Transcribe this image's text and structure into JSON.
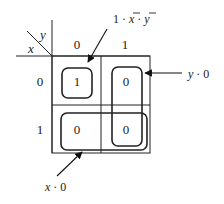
{
  "diagram": {
    "type": "karnaugh-map",
    "row_variable": "x",
    "col_variable": "y",
    "col_headers": [
      "0",
      "1"
    ],
    "row_headers": [
      "0",
      "1"
    ],
    "cells": [
      [
        "1",
        "0"
      ],
      [
        "0",
        "0"
      ]
    ],
    "annotations": {
      "top": {
        "prefix": "1 · ",
        "x_bar": "x",
        "mid": " · ",
        "y_bar": "y"
      },
      "right": {
        "var": "y",
        "rest": " · 0"
      },
      "bottom": {
        "var": "x",
        "rest": " · 0"
      }
    },
    "colors": {
      "line": "#222222",
      "background": "#ffffff"
    }
  }
}
